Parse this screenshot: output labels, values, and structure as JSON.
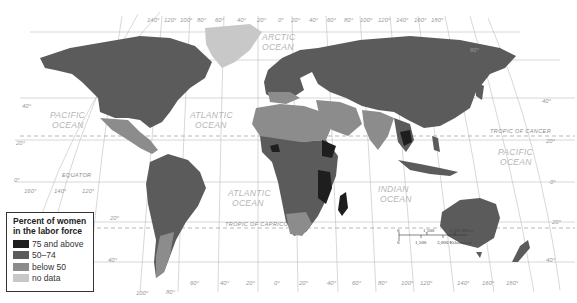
{
  "map": {
    "title": "Percent of women in the labor force",
    "projection": "world (Robinson-like)",
    "legend": {
      "title": "Percent of women in the labor force",
      "items": [
        {
          "label": "75 and above",
          "color": "#1e1e1e"
        },
        {
          "label": "50–74",
          "color": "#5b5b5b"
        },
        {
          "label": "below 50",
          "color": "#8c8c8c"
        },
        {
          "label": "no data",
          "color": "#c8c8c8"
        }
      ]
    },
    "oceans": [
      {
        "label": "PACIFIC",
        "label2": "OCEAN"
      },
      {
        "label": "ATLANTIC",
        "label2": "OCEAN"
      },
      {
        "label": "ARCTIC",
        "label2": "OCEAN"
      },
      {
        "label": "ATLANTIC",
        "label2": "OCEAN"
      },
      {
        "label": "INDIAN",
        "label2": "OCEAN"
      },
      {
        "label": "PACIFIC",
        "label2": "OCEAN"
      }
    ],
    "lines": {
      "equator": "EQUATOR",
      "tropic_cancer": "TROPIC OF CANCER",
      "tropic_capricorn": "TROPIC OF CAPRICORN"
    },
    "top_longitudes": [
      "140°",
      "120°",
      "100°",
      "80°",
      "60°",
      "40°",
      "20°",
      "0°",
      "20°",
      "40°",
      "60°",
      "80°",
      "100°",
      "120°",
      "140°",
      "160°",
      "180°"
    ],
    "bottom_longitudes": [
      "100°",
      "80°",
      "60°",
      "40°",
      "20°",
      "0°",
      "20°",
      "40°",
      "60°",
      "80°",
      "100°",
      "120°",
      "140°",
      "160°",
      "180°"
    ],
    "left_latitudes": [
      "40°",
      "20°",
      "0°",
      "20°",
      "40°"
    ],
    "right_latitudes": [
      "60°",
      "40°",
      "20°",
      "0°",
      "20°",
      "40°"
    ],
    "left_bottom_longitudes": [
      "160°",
      "140°",
      "120°"
    ],
    "scale": {
      "miles": [
        "0",
        "1,500",
        "3,000 Miles"
      ],
      "km": [
        "0",
        "1,500",
        "3,000 Kilometers"
      ]
    }
  }
}
